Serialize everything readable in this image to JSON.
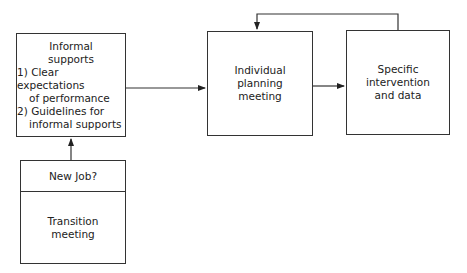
{
  "diagram": {
    "nodes": {
      "informal_supports": {
        "title_line1": "Informal",
        "title_line2": "supports",
        "items": [
          {
            "num": "1)",
            "line1": "Clear expectations",
            "line2": "of performance"
          },
          {
            "num": "2)",
            "line1": "Guidelines for",
            "line2": "informal supports"
          }
        ]
      },
      "transition": {
        "header": "New Job?",
        "line1": "Transition",
        "line2": "meeting"
      },
      "planning": {
        "line1": "Individual",
        "line2": "planning",
        "line3": "meeting"
      },
      "intervention": {
        "line1": "Specific",
        "line2": "intervention",
        "line3": "and data"
      }
    },
    "edges": [
      {
        "from": "transition",
        "to": "informal_supports"
      },
      {
        "from": "informal_supports",
        "to": "planning"
      },
      {
        "from": "planning",
        "to": "intervention"
      },
      {
        "from": "intervention",
        "to": "planning",
        "type": "feedback"
      }
    ],
    "colors": {
      "stroke": "#333333",
      "background": "#ffffff"
    }
  }
}
